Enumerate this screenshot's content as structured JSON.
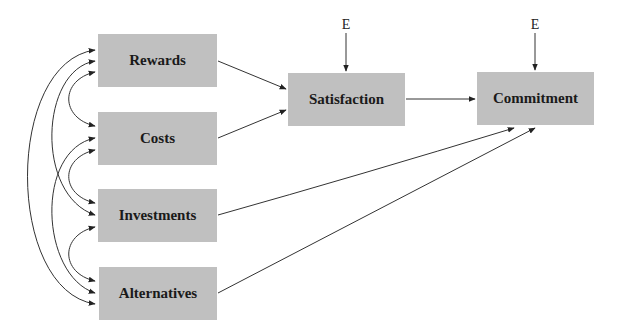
{
  "diagram": {
    "type": "path-model",
    "colors": {
      "box_fill": "#c0c0c0",
      "text": "#1a1a1a",
      "line": "#333333"
    },
    "nodes": [
      {
        "id": "rewards",
        "label": "Rewards",
        "x": 98,
        "y": 34,
        "w": 119,
        "h": 53
      },
      {
        "id": "costs",
        "label": "Costs",
        "x": 98,
        "y": 112,
        "w": 119,
        "h": 53
      },
      {
        "id": "investments",
        "label": "Investments",
        "x": 98,
        "y": 189,
        "w": 119,
        "h": 53
      },
      {
        "id": "alternatives",
        "label": "Alternatives",
        "x": 99,
        "y": 267,
        "w": 118,
        "h": 53
      },
      {
        "id": "satisfaction",
        "label": "Satisfaction",
        "x": 288,
        "y": 73,
        "w": 117,
        "h": 53
      },
      {
        "id": "commitment",
        "label": "Commitment",
        "x": 477,
        "y": 72,
        "w": 117,
        "h": 53
      }
    ],
    "error_terms": [
      {
        "label": "E",
        "target": "satisfaction",
        "x": 346,
        "y": 20
      },
      {
        "label": "E",
        "target": "commitment",
        "x": 535,
        "y": 20
      }
    ],
    "directed_paths": [
      {
        "from": "rewards",
        "to": "satisfaction"
      },
      {
        "from": "costs",
        "to": "satisfaction"
      },
      {
        "from": "satisfaction",
        "to": "commitment"
      },
      {
        "from": "investments",
        "to": "commitment"
      },
      {
        "from": "alternatives",
        "to": "commitment"
      }
    ],
    "covariances": [
      {
        "a": "rewards",
        "b": "costs"
      },
      {
        "a": "rewards",
        "b": "investments"
      },
      {
        "a": "rewards",
        "b": "alternatives"
      },
      {
        "a": "costs",
        "b": "investments"
      },
      {
        "a": "costs",
        "b": "alternatives"
      },
      {
        "a": "investments",
        "b": "alternatives"
      }
    ]
  }
}
